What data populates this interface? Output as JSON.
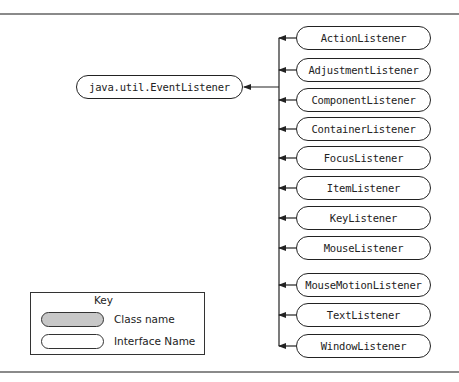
{
  "diagram": {
    "type": "class-hierarchy",
    "root": {
      "label": "java.util.EventListener",
      "kind": "interface"
    },
    "children": [
      {
        "label": "ActionListener",
        "kind": "interface"
      },
      {
        "label": "AdjustmentListener",
        "kind": "interface"
      },
      {
        "label": "ComponentListener",
        "kind": "interface"
      },
      {
        "label": "ContainerListener",
        "kind": "interface"
      },
      {
        "label": "FocusListener",
        "kind": "interface"
      },
      {
        "label": "ItemListener",
        "kind": "interface"
      },
      {
        "label": "KeyListener",
        "kind": "interface"
      },
      {
        "label": "MouseListener",
        "kind": "interface"
      },
      {
        "label": "MouseMotionListener",
        "kind": "interface"
      },
      {
        "label": "TextListener",
        "kind": "interface"
      },
      {
        "label": "WindowListener",
        "kind": "interface"
      }
    ],
    "edge_direction": "child-to-root (arrows point toward java.util.EventListener)"
  },
  "key": {
    "title": "Key",
    "class_label": "Class name",
    "interface_label": "Interface Name",
    "class_fill": "#c8c8c8",
    "interface_fill": "#ffffff"
  }
}
